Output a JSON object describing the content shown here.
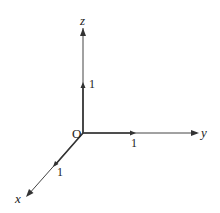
{
  "diagram": {
    "type": "3d-coordinate-axes",
    "origin_label": "O",
    "axes": [
      {
        "name": "x",
        "label": "x",
        "unit_label": "1"
      },
      {
        "name": "y",
        "label": "y",
        "unit_label": "1"
      },
      {
        "name": "z",
        "label": "z",
        "unit_label": "1"
      }
    ],
    "colors": {
      "line": "#333333",
      "background": "#ffffff"
    }
  }
}
